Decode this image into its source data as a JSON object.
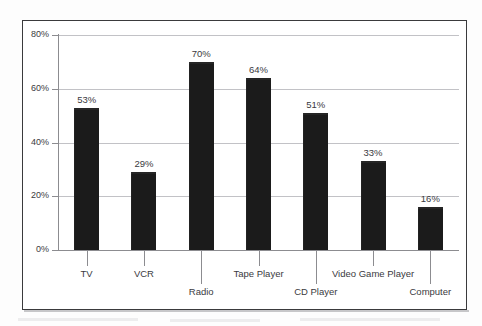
{
  "chart_data": {
    "type": "bar",
    "title": "",
    "subtitle": "",
    "xlabel": "",
    "ylabel": "",
    "categories": [
      "TV",
      "VCR",
      "Radio",
      "Tape Player",
      "CD Player",
      "Video Game Player",
      "Computer"
    ],
    "values": [
      53,
      29,
      70,
      64,
      51,
      33,
      16
    ],
    "value_labels": [
      "53%",
      "29%",
      "70%",
      "64%",
      "51%",
      "33%",
      "16%"
    ],
    "ylim": [
      0,
      80
    ],
    "ytick_values": [
      0,
      20,
      40,
      60,
      80
    ],
    "ytick_labels": [
      "0%",
      "20%",
      "40%",
      "60%",
      "80%"
    ],
    "grid": true,
    "grid_axis": "y",
    "legend": "none",
    "legend_position": "none",
    "bar_color": "#1b1b1b",
    "gridline_color": "#c2c2c6",
    "axis_color": "#8c8c90",
    "text_color": "#3a3a3e",
    "background_color": "#ffffff",
    "label_stagger": [
      "top",
      "top",
      "bottom",
      "top",
      "bottom",
      "top",
      "bottom"
    ]
  }
}
